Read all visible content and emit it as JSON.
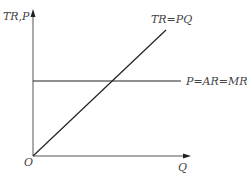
{
  "diagram": {
    "y_axis_label": "TR,P",
    "x_axis_label": "Q",
    "origin_label": "O",
    "curves": [
      {
        "name": "total-revenue",
        "label": "TR=PQ",
        "type": "line",
        "from": [
          0,
          0
        ],
        "slope": "P"
      },
      {
        "name": "price-line",
        "label": "P=AR=MR",
        "type": "horizontal"
      }
    ],
    "colors": {
      "axis": "#555555",
      "line": "#222222",
      "text": "#444444"
    }
  }
}
